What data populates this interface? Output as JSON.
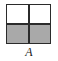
{
  "figure": {
    "label": "A",
    "kind": "square-divided-into-quadrants",
    "outline_color": "#2b2b2b",
    "background_color": "#ffffff",
    "shaded_color": "#a9a9a9",
    "unshaded_color": "#ffffff",
    "rows": 2,
    "columns": 2,
    "shaded_count": "2",
    "total_count": "4",
    "fraction_shaded": "1/2",
    "quadrants": [
      {
        "id": "top-left",
        "fill": "white",
        "shaded": "no"
      },
      {
        "id": "top-right",
        "fill": "white",
        "shaded": "no"
      },
      {
        "id": "bottom-left",
        "fill": "gray",
        "shaded": "yes"
      },
      {
        "id": "bottom-right",
        "fill": "gray",
        "shaded": "yes"
      }
    ]
  }
}
